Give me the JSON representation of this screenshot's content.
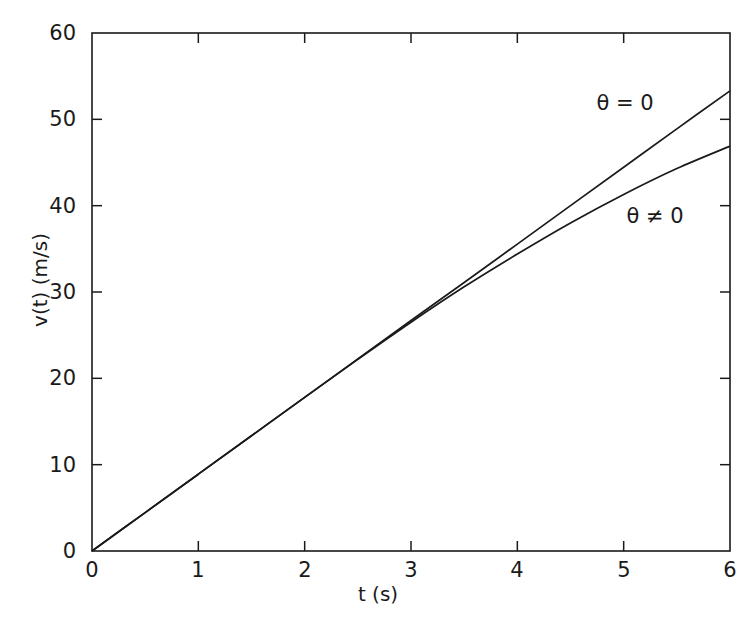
{
  "chart_data": {
    "type": "line",
    "title": "",
    "xlabel": "t (s)",
    "ylabel": "v(t) (m/s)",
    "xlim": [
      0,
      6
    ],
    "ylim": [
      0,
      60
    ],
    "xticks": [
      0,
      1,
      2,
      3,
      4,
      5,
      6
    ],
    "yticks": [
      0,
      10,
      20,
      30,
      40,
      50,
      60
    ],
    "xtick_labels": [
      "0",
      "1",
      "2",
      "3",
      "4",
      "5",
      "6"
    ],
    "ytick_labels": [
      "0",
      "10",
      "20",
      "30",
      "40",
      "50",
      "60"
    ],
    "grid": false,
    "legend_position": "inline-annotations",
    "line_color": "#1a1a1a",
    "background_color": "#ffffff",
    "annotations": [
      {
        "text": "θ = 0",
        "x": 5.02,
        "y": 51.9
      },
      {
        "text": "θ ≠ 0",
        "x": 5.3,
        "y": 38.9
      }
    ],
    "series": [
      {
        "name": "θ = 0",
        "x": [
          0,
          0.5,
          1,
          1.5,
          2,
          2.5,
          3,
          3.5,
          4,
          4.5,
          5,
          5.5,
          6
        ],
        "values": [
          0,
          4.45,
          8.9,
          13.35,
          17.8,
          22.25,
          26.7,
          31.1,
          35.55,
          40.0,
          44.45,
          48.9,
          53.3
        ]
      },
      {
        "name": "θ ≠ 0",
        "x": [
          0,
          0.5,
          1,
          1.5,
          2,
          2.5,
          3,
          3.5,
          4,
          4.5,
          5,
          5.5,
          6
        ],
        "values": [
          0,
          4.45,
          8.9,
          13.35,
          17.8,
          22.2,
          26.5,
          30.6,
          34.4,
          38.0,
          41.3,
          44.3,
          46.9
        ]
      }
    ]
  },
  "axes": {
    "x_title": "t (s)",
    "y_title": "v(t) (m/s)",
    "xticks": [
      {
        "label": "0"
      },
      {
        "label": "1"
      },
      {
        "label": "2"
      },
      {
        "label": "3"
      },
      {
        "label": "4"
      },
      {
        "label": "5"
      },
      {
        "label": "6"
      }
    ],
    "yticks": [
      {
        "label": "60"
      },
      {
        "label": "50"
      },
      {
        "label": "40"
      },
      {
        "label": "30"
      },
      {
        "label": "20"
      },
      {
        "label": "10"
      },
      {
        "label": "0"
      }
    ]
  },
  "annotations": {
    "theta_zero": "θ = 0",
    "theta_nonzero": "θ ≠ 0"
  }
}
